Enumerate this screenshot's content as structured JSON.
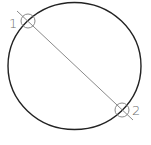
{
  "diagram": {
    "main_circle": {
      "cx": 74.5,
      "cy": 66,
      "rx": 66.5,
      "ry": 63.5,
      "stroke": "#222222"
    },
    "chord_line": {
      "x1": 17,
      "y1": 11,
      "x2": 133,
      "y2": 120,
      "stroke": "#8a8a8a"
    },
    "points": [
      {
        "label": "1",
        "cx": 28,
        "cy": 21,
        "r": 7
      },
      {
        "label": "2",
        "cx": 122,
        "cy": 110,
        "r": 7
      }
    ],
    "marker_color": "#8a8a8a"
  }
}
